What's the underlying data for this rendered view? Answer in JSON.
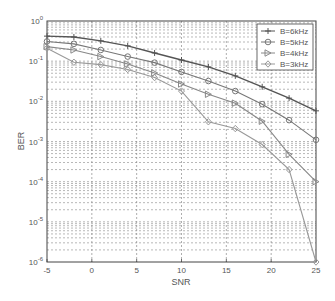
{
  "chart_data": {
    "type": "line",
    "title": "",
    "xlabel": "SNR",
    "ylabel": "BER",
    "yscale": "log",
    "xlim": [
      -5,
      25
    ],
    "ylim": [
      1e-06,
      1
    ],
    "grid": true,
    "legend_position": "upper right",
    "x_ticks": [
      "-5",
      "0",
      "5",
      "10",
      "15",
      "20",
      "25"
    ],
    "y_ticks": [
      "10^0",
      "10^-1",
      "10^-2",
      "10^-3",
      "10^-4",
      "10^-5",
      "10^-6"
    ],
    "x": [
      -5,
      -2,
      1,
      4,
      7,
      10,
      13,
      16,
      19,
      22,
      25
    ],
    "series": [
      {
        "name": "B=6kHz",
        "marker": "+",
        "color": "#555555",
        "values": [
          0.42,
          0.4,
          0.32,
          0.24,
          0.16,
          0.107,
          0.072,
          0.043,
          0.023,
          0.012,
          0.0058
        ]
      },
      {
        "name": "B=5kHz",
        "marker": "o",
        "color": "#777777",
        "values": [
          0.31,
          0.27,
          0.19,
          0.13,
          0.092,
          0.054,
          0.032,
          0.018,
          0.0085,
          0.0034,
          0.0011
        ]
      },
      {
        "name": "B=4kHz",
        "marker": ">",
        "color": "#888888",
        "values": [
          0.23,
          0.19,
          0.13,
          0.085,
          0.051,
          0.027,
          0.015,
          0.009,
          0.0032,
          0.00048,
          0.0001
        ]
      },
      {
        "name": "B=3kHz",
        "marker": "d",
        "color": "#999999",
        "values": [
          0.21,
          0.094,
          0.082,
          0.062,
          0.039,
          0.018,
          0.0031,
          0.0021,
          0.00084,
          0.0002,
          1e-06
        ]
      }
    ]
  },
  "labels": {
    "xlabel": "SNR",
    "ylabel": "BER",
    "legend": [
      "B=6kHz",
      "B=5kHz",
      "B=4kHz",
      "B=3kHz"
    ]
  }
}
